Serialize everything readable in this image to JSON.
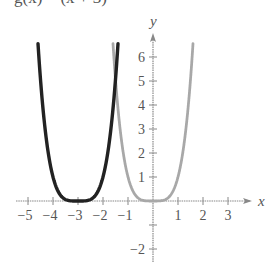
{
  "caption_clipped": "g(x) = (x + 3)⁴",
  "chart_data": {
    "type": "line",
    "title": "",
    "xlabel": "x",
    "ylabel": "y",
    "xlim": [
      -5.5,
      4
    ],
    "ylim": [
      -2.5,
      6.8
    ],
    "x_ticks": [
      -5,
      -4,
      -3,
      -2,
      -1,
      1,
      2,
      3
    ],
    "x_tick_labels": [
      "−5",
      "−4",
      "−3",
      "−2",
      "−1",
      "1",
      "2",
      "3"
    ],
    "y_ticks": [
      -2,
      -1,
      1,
      2,
      3,
      4,
      5,
      6
    ],
    "y_tick_labels": [
      "−2",
      "",
      "1",
      "2",
      "3",
      "4",
      "5",
      "6"
    ],
    "grid": false,
    "series": [
      {
        "name": "f(x) = x^4",
        "color": "#a8a8a8",
        "style": "thick-gray",
        "x": [
          -1.6,
          -1.5,
          -1.25,
          -1.0,
          -0.75,
          -0.5,
          -0.25,
          0,
          0.25,
          0.5,
          0.75,
          1.0,
          1.25,
          1.5,
          1.6
        ],
        "y": [
          6.55,
          5.06,
          2.44,
          1.0,
          0.32,
          0.06,
          0.0,
          0.0,
          0.0,
          0.06,
          0.32,
          1.0,
          2.44,
          5.06,
          6.55
        ]
      },
      {
        "name": "g(x) = (x + 3)^4",
        "color": "#222222",
        "style": "thick-black",
        "x": [
          -4.6,
          -4.5,
          -4.25,
          -4.0,
          -3.75,
          -3.5,
          -3.25,
          -3.0,
          -2.75,
          -2.5,
          -2.25,
          -2.0,
          -1.75,
          -1.5,
          -1.4
        ],
        "y": [
          6.55,
          5.06,
          2.44,
          1.0,
          0.32,
          0.06,
          0.0,
          0.0,
          0.0,
          0.06,
          0.32,
          1.0,
          2.44,
          5.06,
          6.55
        ]
      }
    ]
  }
}
